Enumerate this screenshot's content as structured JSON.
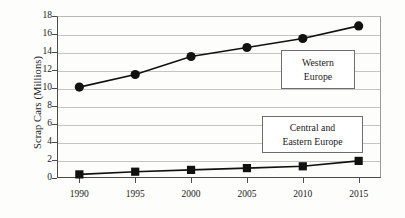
{
  "chart_data": {
    "type": "line",
    "title": "",
    "xlabel": "",
    "ylabel": "Scrap Cars (Millions)",
    "categories": [
      "1990",
      "1995",
      "2000",
      "2005",
      "2010",
      "2015"
    ],
    "x": [
      1990,
      1995,
      2000,
      2005,
      2010,
      2015
    ],
    "xlim": [
      1988,
      2017
    ],
    "ylim": [
      0,
      18
    ],
    "y_ticks": [
      "0",
      "2",
      "4",
      "6",
      "8",
      "10",
      "12",
      "14",
      "16",
      "18"
    ],
    "y_tick_values": [
      0,
      2,
      4,
      6,
      8,
      10,
      12,
      14,
      16,
      18
    ],
    "grid": true,
    "grid_axis": "y",
    "legend_position": "inside-annotations",
    "series": [
      {
        "name": "Western Europe",
        "marker": "circle",
        "color": "#111111",
        "values": [
          10.1,
          11.5,
          13.5,
          14.5,
          15.5,
          16.9
        ]
      },
      {
        "name": "Central and Eastern Europe",
        "marker": "square",
        "color": "#111111",
        "values": [
          0.4,
          0.7,
          0.9,
          1.1,
          1.3,
          1.9
        ]
      }
    ],
    "annotations": [
      {
        "id": "western",
        "lines": [
          "Western",
          "Europe"
        ]
      },
      {
        "id": "central",
        "lines": [
          "Central and",
          "Eastern Europe"
        ]
      }
    ]
  }
}
